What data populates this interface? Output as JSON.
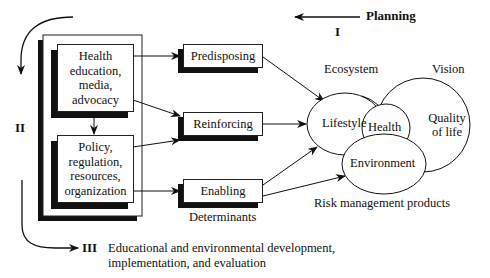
{
  "phases": {
    "planning": {
      "label": "Planning",
      "numeral": "I"
    },
    "phase2": {
      "numeral": "II"
    },
    "phase3": {
      "numeral": "III",
      "label": "Educational and environmental development,\nimplementation, and evaluation"
    }
  },
  "interventions": [
    {
      "id": "health-education",
      "label": "Health\neducation,\nmedia,\nadvocacy"
    },
    {
      "id": "policy",
      "label": "Policy,\nregulation,\nresources,\norganization"
    }
  ],
  "determinants": {
    "caption": "Determinants",
    "items": [
      {
        "id": "predisposing",
        "label": "Predisposing"
      },
      {
        "id": "reinforcing",
        "label": "Reinforcing"
      },
      {
        "id": "enabling",
        "label": "Enabling"
      }
    ]
  },
  "outcomes": {
    "ecosystem_label": "Ecosystem",
    "vision_label": "Vision",
    "risk_label": "Risk management products",
    "lifestyle": "Lifestyle",
    "health": "Health",
    "quality": "Quality\nof life",
    "environment": "Environment"
  },
  "colors": {
    "ink": "#111111",
    "background": "#ffffff"
  }
}
